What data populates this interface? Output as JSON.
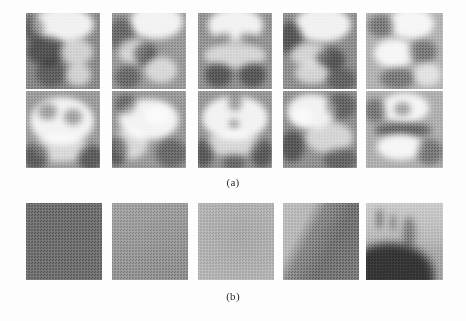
{
  "figure": {
    "background_color": "#fdfdfd",
    "panels": [
      {
        "id": "panel-a",
        "caption": "(a)",
        "description": "Two rows of five grayscale halftone photographs of crumpled / textured specimens",
        "rows": 2,
        "columns": 5,
        "tiles": [
          {
            "row": 0,
            "column": 0,
            "base_color": "#8a8a8a",
            "mean_gray": 138,
            "content": "specimen-top-lit-dome"
          },
          {
            "row": 0,
            "column": 1,
            "base_color": "#9a9a9a",
            "mean_gray": 154,
            "content": "specimen-folded-crest"
          },
          {
            "row": 0,
            "column": 2,
            "base_color": "#949494",
            "mean_gray": 148,
            "content": "specimen-rounded-cap"
          },
          {
            "row": 0,
            "column": 3,
            "base_color": "#8f8f8f",
            "mean_gray": 143,
            "content": "specimen-angled-ridge"
          },
          {
            "row": 0,
            "column": 4,
            "base_color": "#b4b4b4",
            "mean_gray": 180,
            "content": "specimen-pale-cluster"
          },
          {
            "row": 1,
            "column": 0,
            "base_color": "#9c9c9c",
            "mean_gray": 156,
            "content": "specimen-wide-fissured"
          },
          {
            "row": 1,
            "column": 1,
            "base_color": "#9a9a9a",
            "mean_gray": 154,
            "content": "specimen-elongated-lobe"
          },
          {
            "row": 1,
            "column": 2,
            "base_color": "#979797",
            "mean_gray": 151,
            "content": "specimen-symmetric-pair"
          },
          {
            "row": 1,
            "column": 3,
            "base_color": "#929292",
            "mean_gray": 146,
            "content": "specimen-diagonal-fold"
          },
          {
            "row": 1,
            "column": 4,
            "base_color": "#b0b0b0",
            "mean_gray": 176,
            "content": "specimen-pale-crescent"
          }
        ]
      },
      {
        "id": "panel-b",
        "caption": "(b)",
        "description": "One row of five near-uniform grayscale halftone texture patches",
        "rows": 1,
        "columns": 5,
        "tiles": [
          {
            "row": 0,
            "column": 0,
            "base_color": "#6f6f6f",
            "mean_gray": 111,
            "content": "uniform-dark-gray"
          },
          {
            "row": 0,
            "column": 1,
            "base_color": "#989898",
            "mean_gray": 152,
            "content": "uniform-mid-gray"
          },
          {
            "row": 0,
            "column": 2,
            "base_color": "#b2b2b2",
            "mean_gray": 178,
            "content": "uniform-light-gray"
          },
          {
            "row": 0,
            "column": 3,
            "base_color": "#9a9a9a",
            "mean_gray": 154,
            "content": "diagonal-gradient-band"
          },
          {
            "row": 0,
            "column": 4,
            "base_color": "#a8a8a8",
            "mean_gray": 168,
            "content": "dark-foreground-over-light-streaks"
          }
        ]
      }
    ]
  }
}
